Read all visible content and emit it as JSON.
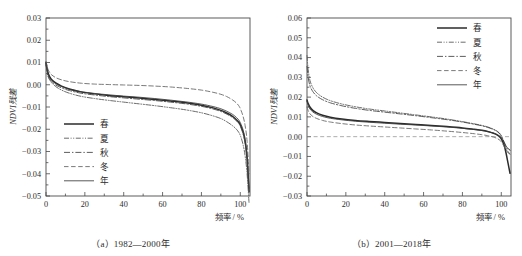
{
  "figure": {
    "ylabel": "NDVI残差",
    "xlabel": "频率 / %",
    "legend_labels": [
      "春",
      "夏",
      "秋",
      "冬",
      "年"
    ]
  },
  "chart_data": [
    {
      "type": "line",
      "title": "（a）1982—2000年",
      "caption": "（a）1982—2000年",
      "xlabel": "频率 / %",
      "ylabel": "NDVI残差",
      "xlim": [
        0,
        105
      ],
      "ylim": [
        -0.05,
        0.03
      ],
      "xticks": [
        0,
        20,
        40,
        60,
        80,
        100
      ],
      "yticks": [
        0.03,
        0.02,
        0.01,
        0.0,
        -0.01,
        -0.02,
        -0.03,
        -0.04,
        -0.05
      ],
      "grid": false,
      "legend_position": "lower-left-inside",
      "x": [
        0,
        1,
        2,
        3,
        5,
        8,
        12,
        18,
        25,
        32,
        40,
        48,
        56,
        64,
        72,
        80,
        86,
        90,
        93,
        96,
        98,
        99.5,
        100.5,
        101.5,
        102.5,
        103.5,
        104.5
      ],
      "series": [
        {
          "name": "春",
          "style": "solid-thick",
          "color": "#2b2b2b",
          "width": 1.5,
          "dash": "none",
          "values": [
            0.01,
            0.0055,
            0.0035,
            0.0022,
            0.0008,
            -0.0006,
            -0.0019,
            -0.0032,
            -0.0041,
            -0.0048,
            -0.0054,
            -0.006,
            -0.0066,
            -0.0073,
            -0.0081,
            -0.0092,
            -0.0104,
            -0.0115,
            -0.0127,
            -0.0142,
            -0.0157,
            -0.0172,
            -0.019,
            -0.0215,
            -0.0255,
            -0.033,
            -0.048
          ]
        },
        {
          "name": "夏",
          "style": "dash-dot-dot",
          "color": "#5a5a5a",
          "width": 0.9,
          "dash": "5,1.6,1,1.6,1,1.6",
          "values": [
            0.0092,
            0.004,
            0.002,
            0.0008,
            -0.0008,
            -0.0024,
            -0.0038,
            -0.0052,
            -0.0062,
            -0.007,
            -0.0078,
            -0.0086,
            -0.0094,
            -0.0103,
            -0.0113,
            -0.0126,
            -0.014,
            -0.0152,
            -0.0166,
            -0.0184,
            -0.02,
            -0.0218,
            -0.024,
            -0.0272,
            -0.032,
            -0.04,
            -0.053
          ]
        },
        {
          "name": "秋",
          "style": "dash-dot",
          "color": "#4a4a4a",
          "width": 0.9,
          "dash": "6,2,1.4,2",
          "values": [
            0.0088,
            0.0042,
            0.0024,
            0.0013,
            -0.0001,
            -0.0014,
            -0.0026,
            -0.0038,
            -0.0046,
            -0.0053,
            -0.0059,
            -0.0065,
            -0.0071,
            -0.0078,
            -0.0086,
            -0.0097,
            -0.0109,
            -0.012,
            -0.0132,
            -0.0147,
            -0.0162,
            -0.0178,
            -0.0197,
            -0.0223,
            -0.0264,
            -0.034,
            -0.049
          ]
        },
        {
          "name": "冬",
          "style": "dashed",
          "color": "#6a6a6a",
          "width": 0.9,
          "dash": "4.5,2.6",
          "values": [
            0.0105,
            0.007,
            0.0054,
            0.0044,
            0.0032,
            0.0022,
            0.0014,
            0.0007,
            0.0003,
            0.0001,
            -0.0001,
            -0.0003,
            -0.0006,
            -0.001,
            -0.0016,
            -0.0024,
            -0.0034,
            -0.0043,
            -0.0053,
            -0.0068,
            -0.0082,
            -0.0098,
            -0.0118,
            -0.0144,
            -0.0184,
            -0.0254,
            -0.04
          ]
        },
        {
          "name": "年",
          "style": "solid-thin",
          "color": "#3a3a3a",
          "width": 0.85,
          "dash": "none",
          "values": [
            0.0098,
            0.005,
            0.0031,
            0.0019,
            0.0005,
            -0.0008,
            -0.002,
            -0.0031,
            -0.0039,
            -0.0045,
            -0.0051,
            -0.0056,
            -0.0062,
            -0.0069,
            -0.0077,
            -0.0087,
            -0.0098,
            -0.0108,
            -0.0119,
            -0.0133,
            -0.0147,
            -0.0162,
            -0.018,
            -0.0205,
            -0.0245,
            -0.0318,
            -0.0465
          ]
        }
      ]
    },
    {
      "type": "line",
      "title": "（b）2001—2018年",
      "caption": "（b）2001—2018年",
      "xlabel": "频率 / %",
      "ylabel": "NDVI残差",
      "xlim": [
        0,
        105
      ],
      "ylim": [
        -0.03,
        0.06
      ],
      "xticks": [
        0,
        20,
        40,
        60,
        80,
        100
      ],
      "yticks": [
        0.06,
        0.05,
        0.04,
        0.03,
        0.02,
        0.01,
        0.0,
        -0.01,
        -0.02,
        -0.03
      ],
      "grid": false,
      "legend_position": "upper-right-inside",
      "x": [
        0,
        0.6,
        1.5,
        3,
        5,
        8,
        12,
        18,
        25,
        32,
        40,
        48,
        56,
        64,
        72,
        80,
        86,
        90,
        93,
        96,
        98,
        99.5,
        100.5,
        101.5,
        102.5,
        103.5,
        104.5
      ],
      "series": [
        {
          "name": "春",
          "style": "solid-thick",
          "color": "#2b2b2b",
          "width": 1.5,
          "dash": "none",
          "values": [
            0.0185,
            0.0168,
            0.015,
            0.0133,
            0.012,
            0.0108,
            0.0098,
            0.0089,
            0.0082,
            0.0077,
            0.0072,
            0.0067,
            0.0062,
            0.0057,
            0.0051,
            0.0044,
            0.0037,
            0.0032,
            0.0026,
            0.0017,
            0.0008,
            -0.0004,
            -0.002,
            -0.0045,
            -0.0085,
            -0.0135,
            -0.0185
          ]
        },
        {
          "name": "夏",
          "style": "dash-dot-dot",
          "color": "#5a5a5a",
          "width": 0.9,
          "dash": "5,1.6,1,1.6,1,1.6",
          "values": [
            0.041,
            0.034,
            0.0285,
            0.0248,
            0.0222,
            0.02,
            0.0182,
            0.0165,
            0.0151,
            0.014,
            0.013,
            0.012,
            0.011,
            0.01,
            0.0089,
            0.0076,
            0.0065,
            0.0057,
            0.0049,
            0.0038,
            0.0027,
            0.0013,
            -0.0005,
            -0.0028,
            -0.005,
            -0.0062,
            -0.0068
          ]
        },
        {
          "name": "秋",
          "style": "dash-dot",
          "color": "#4a4a4a",
          "width": 0.9,
          "dash": "6,2,1.4,2",
          "values": [
            0.0355,
            0.03,
            0.0258,
            0.0228,
            0.0206,
            0.0187,
            0.0171,
            0.0156,
            0.0143,
            0.0133,
            0.0124,
            0.0115,
            0.0106,
            0.0096,
            0.0086,
            0.0074,
            0.0063,
            0.0055,
            0.0047,
            0.0036,
            0.0025,
            0.0011,
            -0.0008,
            -0.0032,
            -0.0058,
            -0.0076,
            -0.0088
          ]
        },
        {
          "name": "冬",
          "style": "dashed",
          "color": "#6a6a6a",
          "width": 0.9,
          "dash": "4.5,2.6",
          "values": [
            0.015,
            0.0132,
            0.0116,
            0.0102,
            0.0092,
            0.0082,
            0.0074,
            0.0066,
            0.0059,
            0.0054,
            0.0049,
            0.0044,
            0.0039,
            0.0034,
            0.0028,
            0.0021,
            0.0015,
            0.001,
            0.0005,
            -0.0002,
            -0.001,
            -0.002,
            -0.0033,
            -0.005,
            -0.0068,
            -0.0082,
            -0.0092
          ]
        },
        {
          "name": "年",
          "style": "solid-thin",
          "color": "#3a3a3a",
          "width": 0.85,
          "dash": "none",
          "values": [
            0.0178,
            0.0158,
            0.014,
            0.0125,
            0.0113,
            0.0102,
            0.0093,
            0.0085,
            0.0078,
            0.0073,
            0.0068,
            0.0063,
            0.0059,
            0.0054,
            0.0049,
            0.0042,
            0.0036,
            0.0031,
            0.0026,
            0.0018,
            0.001,
            0.0,
            -0.0013,
            -0.003,
            -0.0048,
            -0.006,
            -0.0068
          ]
        }
      ],
      "zero_reference_line": {
        "value": 0.0,
        "style": "dashed",
        "color": "#8a8a8a"
      }
    }
  ]
}
